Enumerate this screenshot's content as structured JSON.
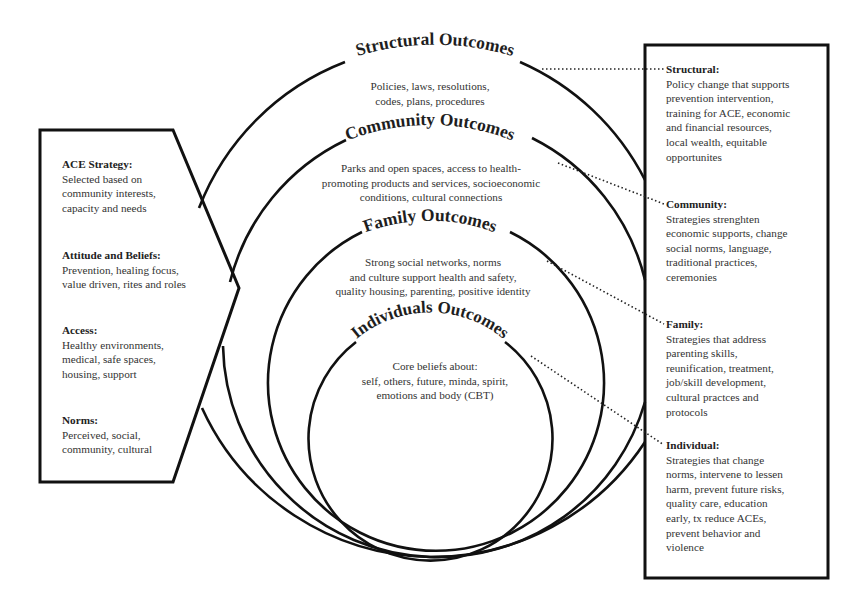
{
  "diagram": {
    "left_panel": {
      "sections": [
        {
          "heading": "ACE Strategy:",
          "body": "Selected based on\ncommunity interests,\ncapacity and needs"
        },
        {
          "heading": "Attitude and Beliefs:",
          "body": "Prevention, healing focus,\nvalue driven, rites and roles"
        },
        {
          "heading": "Access:",
          "body": "Healthy environments,\nmedical, safe spaces,\nhousing, support"
        },
        {
          "heading": "Norms:",
          "body": "Perceived, social,\ncommunity, cultural"
        }
      ]
    },
    "rings": [
      {
        "title": "Structural Outcomes",
        "body": "Policies, laws, resolutions,\ncodes, plans, procedures"
      },
      {
        "title": "Community Outcomes",
        "body": "Parks and open spaces, access to health-\npromoting products and services, socioeconomic\nconditions, cultural connections"
      },
      {
        "title": "Family Outcomes",
        "body": "Strong social networks, norms\nand culture support health and safety,\nquality housing, parenting, positive identity"
      },
      {
        "title": "Individuals Outcomes",
        "body": "Core beliefs about:\nself, others, future, minda, spirit,\nemotions and body (CBT)"
      }
    ],
    "right_panel": {
      "sections": [
        {
          "heading": "Structural:",
          "body": "Policy change that supports\nprevention intervention,\ntraining for ACE, economic\nand financial resources,\nlocal wealth, equitable\nopportunites"
        },
        {
          "heading": "Community:",
          "body": "Strategies strenghten\neconomic supports, change\nsocial norms, language,\ntraditional practices,\nceremonies"
        },
        {
          "heading": "Family:",
          "body": "Strategies that address\nparenting skills,\nreunification, treatment,\njob/skill development,\ncultural practces and\nprotocols"
        },
        {
          "heading": "Individual:",
          "body": "Strategies that change\nnorms, intervene to lessen\nharm, prevent future risks,\nquality care, education\nearly, tx reduce ACEs,\nprevent behavior and\nviolence"
        }
      ]
    },
    "colors": {
      "line": "#111111",
      "text": "#333333",
      "background": "#ffffff"
    }
  }
}
